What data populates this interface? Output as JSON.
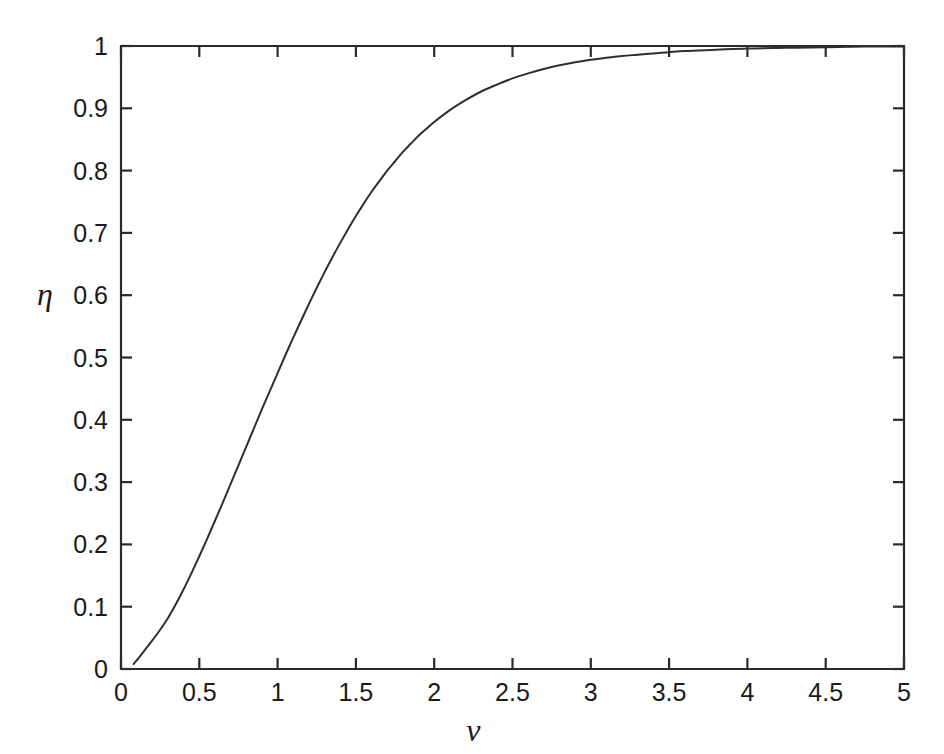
{
  "chart_data": {
    "type": "line",
    "title": "",
    "subtitle": "",
    "xlabel": "ν",
    "ylabel": "η",
    "xlim": [
      0,
      5
    ],
    "ylim": [
      0,
      1
    ],
    "grid": false,
    "legend": null,
    "line_color": "#2f2f2f",
    "axis_color": "#2b2b2b",
    "background_color": "#ffffff",
    "xticks": [
      0,
      0.5,
      1,
      1.5,
      2,
      2.5,
      3,
      3.5,
      4,
      4.5,
      5
    ],
    "xticklabels": [
      "0",
      "0.5",
      "1",
      "1.5",
      "2",
      "2.5",
      "3",
      "3.5",
      "4",
      "4.5",
      "5"
    ],
    "yticks": [
      0,
      0.1,
      0.2,
      0.3,
      0.4,
      0.5,
      0.6,
      0.7,
      0.8,
      0.9,
      1
    ],
    "yticklabels": [
      "0",
      "0.1",
      "0.2",
      "0.3",
      "0.4",
      "0.5",
      "0.6",
      "0.7",
      "0.8",
      "0.9",
      "1"
    ],
    "series": [
      {
        "name": "efficiency",
        "x": [
          0.08,
          0.12,
          0.16,
          0.2,
          0.25,
          0.3,
          0.35,
          0.4,
          0.45,
          0.5,
          0.55,
          0.6,
          0.65,
          0.7,
          0.75,
          0.8,
          0.85,
          0.9,
          0.95,
          1.0,
          1.05,
          1.1,
          1.15,
          1.2,
          1.25,
          1.3,
          1.35,
          1.4,
          1.45,
          1.5,
          1.55,
          1.6,
          1.65,
          1.7,
          1.75,
          1.8,
          1.85,
          1.9,
          1.95,
          2.0,
          2.1,
          2.2,
          2.3,
          2.4,
          2.5,
          2.6,
          2.7,
          2.8,
          2.9,
          3.0,
          3.1,
          3.2,
          3.3,
          3.4,
          3.5,
          3.6,
          3.8,
          4.0,
          4.25,
          4.5,
          4.75,
          5.0
        ],
        "y": [
          0.008,
          0.02,
          0.033,
          0.046,
          0.063,
          0.082,
          0.104,
          0.128,
          0.154,
          0.181,
          0.209,
          0.238,
          0.267,
          0.297,
          0.327,
          0.357,
          0.387,
          0.417,
          0.446,
          0.475,
          0.504,
          0.532,
          0.559,
          0.586,
          0.612,
          0.637,
          0.661,
          0.684,
          0.706,
          0.727,
          0.747,
          0.766,
          0.783,
          0.8,
          0.815,
          0.83,
          0.843,
          0.856,
          0.867,
          0.878,
          0.897,
          0.913,
          0.927,
          0.938,
          0.948,
          0.956,
          0.963,
          0.969,
          0.974,
          0.978,
          0.981,
          0.984,
          0.986,
          0.988,
          0.99,
          0.992,
          0.994,
          0.996,
          0.997,
          0.998,
          0.999,
          0.999
        ]
      }
    ]
  },
  "layout": {
    "plot_left": 121,
    "plot_right": 904,
    "plot_top": 46,
    "plot_bottom": 669
  }
}
